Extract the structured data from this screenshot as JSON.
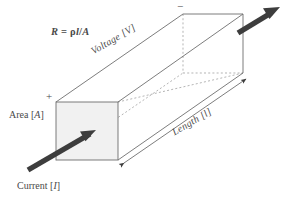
{
  "figure": {
    "background_color": "#ffffff",
    "line_color": "#6e6e6e",
    "dashed_color": "#9a9a9a",
    "arrow_color": "#3d3d3d",
    "front_face_fill": "#f1f1f1",
    "text_color": "#4a4a4a"
  },
  "labels": {
    "formula_r": "R",
    "formula_eq": " = ",
    "formula_rho": "ρ",
    "formula_l": "l",
    "formula_slash": "/",
    "formula_a": "A",
    "formula_full": "R = ρl/A",
    "voltage_text": "Voltage [",
    "voltage_symbol": "V",
    "voltage_close": "]",
    "voltage_full": "Voltage [V]",
    "length_text": "Length [",
    "length_symbol": "l",
    "length_close": "]",
    "length_full": "Length [l]",
    "area_text": "Area [",
    "area_symbol": "A",
    "area_close": "]",
    "area_full": "Area [A]",
    "current_text": "Current [",
    "current_symbol": "I",
    "current_close": "]",
    "current_full": "Current [I]",
    "plus_terminal": "+",
    "minus_terminal": "−"
  },
  "geometry": {
    "front_face": {
      "x": 56,
      "y": 102,
      "width": 62,
      "height": 58
    },
    "back_face": {
      "x": 183,
      "y": 14,
      "width": 60,
      "height": 59
    },
    "depth_offset_x": 127,
    "depth_offset_y": -88,
    "current_arrow": {
      "x1": 28,
      "y1": 170,
      "x2": 94,
      "y2": 132
    },
    "exit_arrow": {
      "x1": 238,
      "y1": 32,
      "x2": 279,
      "y2": 7
    },
    "length_dimension": {
      "x1": 122,
      "y1": 164,
      "x2": 248,
      "y2": 77
    }
  },
  "icons": {
    "current_arrow": "arrow-up-right-icon",
    "exit_arrow": "arrow-up-right-icon",
    "dimension_arrow_start": "arrow-head-icon",
    "dimension_arrow_end": "arrow-head-icon"
  }
}
